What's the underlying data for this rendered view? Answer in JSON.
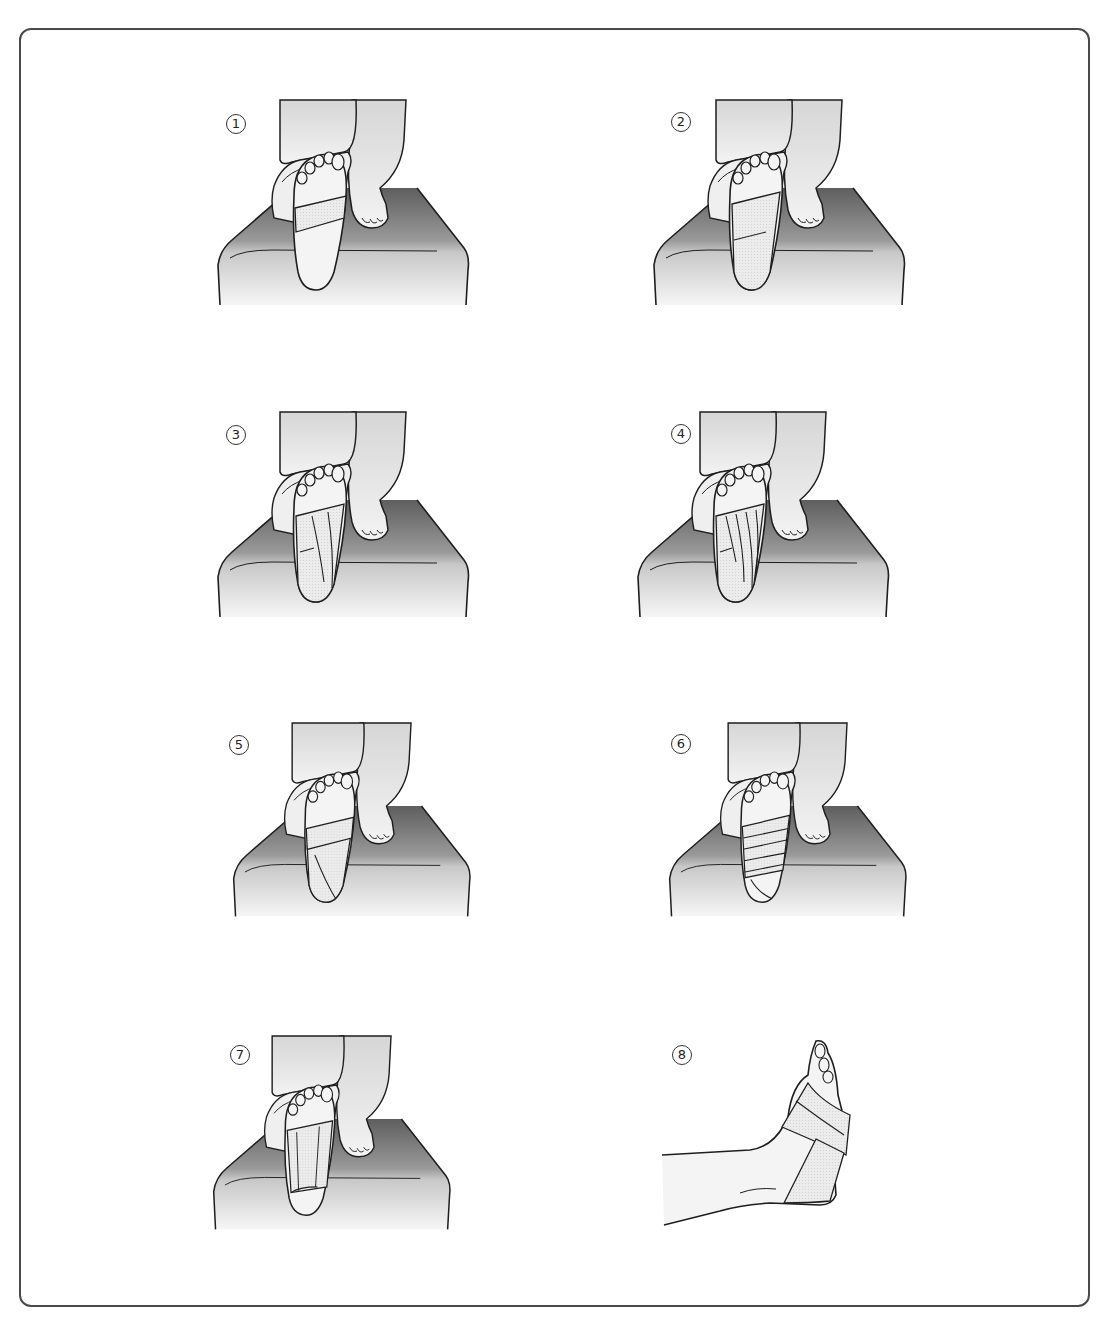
{
  "figure": {
    "type": "instructional illustration",
    "steps": [
      {
        "number": "1",
        "glyph": "①",
        "description": "Anchor tape wrapped across the ball of the foot; sole facing viewer, knee resting on bench"
      },
      {
        "number": "2",
        "glyph": "②",
        "description": "Longitudinal strip from forefoot anchor down the sole to heel"
      },
      {
        "number": "3",
        "glyph": "③",
        "description": "Additional fan-shaped strips along the arch toward the heel"
      },
      {
        "number": "4",
        "glyph": "④",
        "description": "More overlapping strips covering the arch"
      },
      {
        "number": "5",
        "glyph": "⑤",
        "description": "Horizontal strip across the midfoot securing strips"
      },
      {
        "number": "6",
        "glyph": "⑥",
        "description": "Multiple horizontal overlapping strips across the arch"
      },
      {
        "number": "7",
        "glyph": "⑦",
        "description": "Finished taping of the sole, heel exposed"
      },
      {
        "number": "8",
        "glyph": "⑧",
        "description": "Side view of finished taped foot and ankle"
      }
    ]
  },
  "colors": {
    "frame": "#4a4a4a",
    "line": "#1e1e1e",
    "bench_dark": "#6b6b6b",
    "bench_light": "#f2f2f2",
    "skin": "#f4f4f4",
    "tape": "#e4e4e4"
  }
}
